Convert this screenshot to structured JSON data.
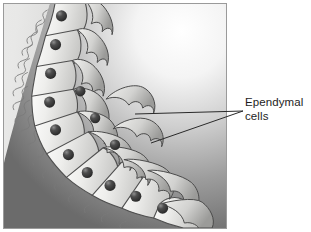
{
  "figure": {
    "kind": "biological-illustration",
    "panel": {
      "border_color": "#9a9a9a",
      "background_color": "#f2f2f2",
      "lumen_color": "#ededec",
      "tissue_dark_color": "#6f6f6f",
      "highlight_color": "#ffffff"
    },
    "canvas_background": "#ffffff"
  },
  "annotation": {
    "label_lines": [
      "Ependymal",
      "cells"
    ],
    "text_color": "#1d1d1d",
    "leader_color": "#2a2a2a",
    "leader_count": 2
  },
  "structures": {
    "cell_layer_name": "ependymal cell layer",
    "nucleus_name": "nucleus",
    "cilia_name": "cilia",
    "process_name": "basal process",
    "lumen_name": "ventricular lumen",
    "nucleus_color": "#3a3a3a",
    "cell_body_color": "#e6e6e4",
    "cell_outline_color": "#4f4f4f",
    "cilia_color": "#7b7b7b",
    "nuclei_count": 13
  }
}
